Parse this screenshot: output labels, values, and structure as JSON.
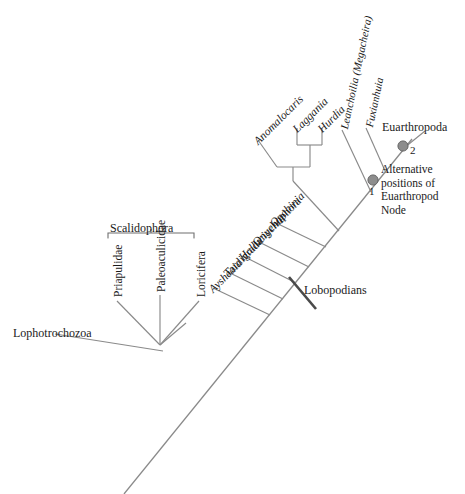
{
  "figure": {
    "type": "phylogenetic-cladogram",
    "title": "",
    "background_color": "#ffffff",
    "line_color": "#8a8a8a",
    "text_color": "#1a1a1a",
    "node_marker_color": "#8d8d8d"
  },
  "taxa": {
    "outgroup": {
      "label": "Lophotrochozoa",
      "italic": false
    },
    "scalidophora_members": [
      {
        "label": "Priapulidae",
        "italic": false
      },
      {
        "label": "Paleoaculicidae",
        "italic": false
      },
      {
        "label": "Loricifera",
        "italic": false
      }
    ],
    "lobopodian_grade": [
      {
        "label": "Aysheaia",
        "italic": true
      },
      {
        "label": "Tardigrada",
        "italic": false
      },
      {
        "label": "Hallucigenia",
        "italic": true
      },
      {
        "label": "Onychophora",
        "italic": false
      },
      {
        "label": "Opabinia",
        "italic": true
      }
    ],
    "anomalocarid_clade": [
      {
        "label": "Anomalocaris",
        "italic": true
      },
      {
        "label": "Laggania",
        "italic": true
      },
      {
        "label": "Hurdia",
        "italic": true
      }
    ],
    "stem_euarthropods": [
      {
        "label": "Leanchoilia (Megacheira)",
        "italic": true
      },
      {
        "label": "Fuxianhuia",
        "italic": true
      }
    ],
    "crown": {
      "label": "Euarthropoda",
      "italic": false
    }
  },
  "clade_labels": {
    "scalidophora": "Scalidophora",
    "lobopodians": "Lobopodians"
  },
  "annotations": {
    "node_one_number": "1",
    "node_two_number": "2",
    "alternative_node_caption": "Alternative positions of Euarthropod Node"
  }
}
